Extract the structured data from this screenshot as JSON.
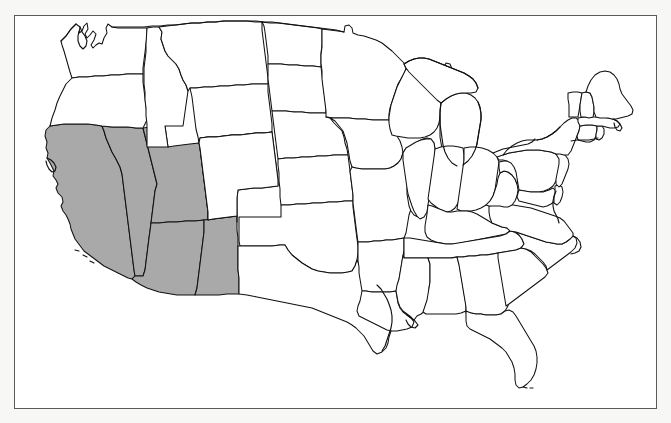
{
  "image": {
    "subject": "Map of the contiguous United States with state boundaries",
    "title": "",
    "caption": ""
  },
  "frame": {
    "border_color": "#5a5a5a",
    "background_color": "#ffffff",
    "page_background_color": "#f7f7f5"
  },
  "map": {
    "projection_note": "contiguous United States, curved northern border",
    "line_color": "#111111",
    "default_state_fill": "#ffffff",
    "highlight_fill": "#a9a9a9",
    "highlighted_region_label": "Southwest",
    "highlighted_states": [
      "California",
      "Nevada",
      "Utah",
      "Arizona",
      "New Mexico"
    ],
    "unhighlighted_states": [
      "Washington",
      "Oregon",
      "Idaho",
      "Montana",
      "Wyoming",
      "Colorado",
      "North Dakota",
      "South Dakota",
      "Nebraska",
      "Kansas",
      "Oklahoma",
      "Texas",
      "Minnesota",
      "Iowa",
      "Missouri",
      "Arkansas",
      "Louisiana",
      "Wisconsin",
      "Illinois",
      "Michigan",
      "Indiana",
      "Ohio",
      "Kentucky",
      "Tennessee",
      "Mississippi",
      "Alabama",
      "Georgia",
      "Florida",
      "South Carolina",
      "North Carolina",
      "Virginia",
      "West Virginia",
      "Maryland",
      "Delaware",
      "Pennsylvania",
      "New Jersey",
      "New York",
      "Connecticut",
      "Rhode Island",
      "Massachusetts",
      "Vermont",
      "New Hampshire",
      "Maine"
    ],
    "state_count_shown": 48,
    "legend": [],
    "labels": []
  }
}
